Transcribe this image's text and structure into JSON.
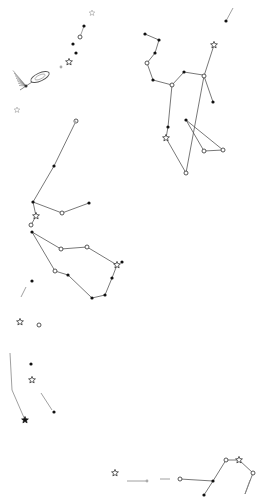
{
  "colors": {
    "background": "#ffffff",
    "line": "#555555",
    "star_fill": "#111111",
    "faint": "#aaaaaa"
  },
  "constellations": [
    {
      "name": "upper-right-figure",
      "lines": [
        [
          [
            145,
            34
          ],
          [
            159,
            40
          ],
          [
            155,
            53
          ],
          [
            147,
            63
          ],
          [
            153,
            80
          ],
          [
            172,
            85
          ],
          [
            184,
            72
          ],
          [
            203,
            75
          ]
        ],
        [
          [
            214,
            45
          ],
          [
            204,
            76
          ],
          [
            186,
            173
          ]
        ],
        [
          [
            204,
            76
          ],
          [
            213,
            102
          ]
        ],
        [
          [
            172,
            85
          ],
          [
            168,
            127
          ],
          [
            166,
            138
          ],
          [
            186,
            173
          ]
        ],
        [
          [
            186,
            120
          ],
          [
            204,
            151
          ],
          [
            223,
            150
          ],
          [
            186,
            120
          ]
        ]
      ],
      "stars": [
        {
          "x": 145,
          "y": 34,
          "type": "dot"
        },
        {
          "x": 159,
          "y": 40,
          "type": "dot"
        },
        {
          "x": 155,
          "y": 53,
          "type": "dot"
        },
        {
          "x": 147,
          "y": 63,
          "type": "ring"
        },
        {
          "x": 153,
          "y": 80,
          "type": "dot"
        },
        {
          "x": 172,
          "y": 85,
          "type": "ring"
        },
        {
          "x": 184,
          "y": 72,
          "type": "dot"
        },
        {
          "x": 214,
          "y": 45,
          "type": "star"
        },
        {
          "x": 204,
          "y": 76,
          "type": "ring"
        },
        {
          "x": 213,
          "y": 102,
          "type": "dot"
        },
        {
          "x": 168,
          "y": 127,
          "type": "dot"
        },
        {
          "x": 166,
          "y": 138,
          "type": "star"
        },
        {
          "x": 186,
          "y": 120,
          "type": "dot"
        },
        {
          "x": 204,
          "y": 151,
          "type": "ring"
        },
        {
          "x": 223,
          "y": 150,
          "type": "ring"
        },
        {
          "x": 186,
          "y": 173,
          "type": "ring"
        }
      ]
    },
    {
      "name": "middle-left-figure",
      "lines": [
        [
          [
            76,
            121
          ],
          [
            54,
            166
          ],
          [
            33,
            202
          ],
          [
            62,
            213
          ],
          [
            89,
            203
          ]
        ],
        [
          [
            33,
            202
          ],
          [
            36,
            216
          ],
          [
            31,
            225
          ]
        ],
        [
          [
            32,
            232
          ],
          [
            61,
            249
          ],
          [
            87,
            247
          ],
          [
            117,
            265
          ],
          [
            112,
            278
          ],
          [
            105,
            295
          ],
          [
            92,
            298
          ],
          [
            68,
            275
          ],
          [
            55,
            271
          ],
          [
            32,
            232
          ]
        ]
      ],
      "stars": [
        {
          "x": 76,
          "y": 121,
          "type": "ring"
        },
        {
          "x": 54,
          "y": 166,
          "type": "dot"
        },
        {
          "x": 33,
          "y": 202,
          "type": "dot"
        },
        {
          "x": 62,
          "y": 213,
          "type": "ring"
        },
        {
          "x": 89,
          "y": 203,
          "type": "dot"
        },
        {
          "x": 36,
          "y": 216,
          "type": "star"
        },
        {
          "x": 31,
          "y": 225,
          "type": "ring"
        },
        {
          "x": 32,
          "y": 232,
          "type": "dot"
        },
        {
          "x": 61,
          "y": 249,
          "type": "ring"
        },
        {
          "x": 87,
          "y": 247,
          "type": "ring"
        },
        {
          "x": 117,
          "y": 265,
          "type": "star"
        },
        {
          "x": 112,
          "y": 278,
          "type": "dot"
        },
        {
          "x": 105,
          "y": 295,
          "type": "dot"
        },
        {
          "x": 92,
          "y": 298,
          "type": "dot"
        },
        {
          "x": 68,
          "y": 275,
          "type": "dot"
        },
        {
          "x": 55,
          "y": 271,
          "type": "ring"
        }
      ]
    },
    {
      "name": "bottom-right-figure",
      "lines": [
        [
          [
            180,
            479
          ],
          [
            213,
            481
          ],
          [
            226,
            460
          ],
          [
            239,
            460
          ],
          [
            253,
            473
          ],
          [
            245,
            494
          ]
        ],
        [
          [
            213,
            481
          ],
          [
            204,
            495
          ]
        ]
      ],
      "stars": [
        {
          "x": 180,
          "y": 479,
          "type": "ring"
        },
        {
          "x": 213,
          "y": 481,
          "type": "dot"
        },
        {
          "x": 204,
          "y": 495,
          "type": "dot"
        },
        {
          "x": 226,
          "y": 460,
          "type": "ring"
        },
        {
          "x": 239,
          "y": 460,
          "type": "star"
        },
        {
          "x": 253,
          "y": 473,
          "type": "ring"
        }
      ]
    }
  ],
  "isolated_stars": [
    {
      "x": 92,
      "y": 13,
      "type": "faint-star"
    },
    {
      "x": 84,
      "y": 26,
      "type": "dot"
    },
    {
      "x": 80,
      "y": 37,
      "type": "ring"
    },
    {
      "x": 73,
      "y": 44,
      "type": "dot"
    },
    {
      "x": 76,
      "y": 53,
      "type": "dot"
    },
    {
      "x": 69,
      "y": 62,
      "type": "star"
    },
    {
      "x": 61,
      "y": 67,
      "type": "faint"
    },
    {
      "x": 17,
      "y": 110,
      "type": "faint-star"
    },
    {
      "x": 75,
      "y": 122,
      "type": "faint"
    },
    {
      "x": 122,
      "y": 262,
      "type": "dot"
    },
    {
      "x": 32,
      "y": 281,
      "type": "dot"
    },
    {
      "x": 20,
      "y": 322,
      "type": "star"
    },
    {
      "x": 39,
      "y": 325,
      "type": "ring"
    },
    {
      "x": 31,
      "y": 364,
      "type": "dot"
    },
    {
      "x": 32,
      "y": 380,
      "type": "star"
    },
    {
      "x": 54,
      "y": 412,
      "type": "dot"
    },
    {
      "x": 25,
      "y": 420,
      "type": "star-dark"
    },
    {
      "x": 115,
      "y": 473,
      "type": "star"
    },
    {
      "x": 147,
      "y": 481,
      "type": "faint"
    },
    {
      "x": 226,
      "y": 21,
      "type": "dot"
    }
  ],
  "extra_strokes": [
    [
      [
        226,
        21
      ],
      [
        233,
        8
      ]
    ],
    [
      [
        80,
        37
      ],
      [
        84,
        26
      ]
    ],
    [
      [
        21,
        297
      ],
      [
        26,
        287
      ]
    ],
    [
      [
        41,
        393
      ],
      [
        52,
        410
      ]
    ],
    [
      [
        10,
        353
      ],
      [
        12,
        390
      ],
      [
        25,
        420
      ]
    ],
    [
      [
        127,
        481
      ],
      [
        147,
        481
      ]
    ],
    [
      [
        160,
        479
      ],
      [
        170,
        479
      ]
    ],
    [
      [
        245,
        494
      ],
      [
        250,
        480
      ]
    ]
  ],
  "galaxies": [
    {
      "x": 40,
      "y": 77,
      "rx": 10,
      "ry": 4,
      "angle": -25
    },
    {
      "x": 26,
      "y": 86,
      "type": "comet"
    }
  ]
}
